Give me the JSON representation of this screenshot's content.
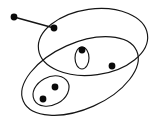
{
  "figure": {
    "background_color": "#ffffff",
    "stroke_color": "#151515",
    "dot_color": "#0a0a0a",
    "width": 159,
    "height": 123
  },
  "chart_data": {
    "type": "diagram",
    "xlabel": "",
    "ylabel": "",
    "grid": false,
    "legend": false,
    "xlim": [
      0,
      159
    ],
    "ylim": [
      0,
      123
    ],
    "ellipses": [
      {
        "name": "upper-right-large-ellipse",
        "cx": 93,
        "cy": 42,
        "rx": 55,
        "ry": 33,
        "rotation": -8,
        "fill": "none",
        "stroke": "#151515"
      },
      {
        "name": "lower-left-large-ellipse",
        "cx": 80,
        "cy": 76,
        "rx": 62,
        "ry": 33,
        "rotation": -24,
        "fill": "none",
        "stroke": "#151515"
      },
      {
        "name": "small-vertical-ellipse",
        "cx": 82,
        "cy": 58,
        "rx": 7,
        "ry": 11,
        "rotation": 0,
        "fill": "none",
        "stroke": "#151515"
      },
      {
        "name": "small-tilted-ellipse",
        "cx": 51,
        "cy": 91,
        "rx": 19,
        "ry": 14,
        "rotation": -28,
        "fill": "none",
        "stroke": "#151515"
      }
    ],
    "points": [
      {
        "name": "outer-free-point",
        "x": 14,
        "y": 17,
        "r": 3.4
      },
      {
        "name": "edge-endpoint-point",
        "x": 54,
        "y": 28,
        "r": 3.4
      },
      {
        "name": "point-above-small-vertical-ellipse",
        "x": 82,
        "y": 50,
        "r": 3.4
      },
      {
        "name": "right-interior-point",
        "x": 112,
        "y": 66,
        "r": 3.4
      },
      {
        "name": "inner-upper-point",
        "x": 55,
        "y": 87,
        "r": 3.4
      },
      {
        "name": "inner-lower-point",
        "x": 43,
        "y": 99,
        "r": 3.4
      }
    ],
    "edges": [
      {
        "name": "edge-outer-to-inner",
        "x1": 14,
        "y1": 17,
        "x2": 54,
        "y2": 28,
        "stroke": "#151515"
      }
    ]
  }
}
